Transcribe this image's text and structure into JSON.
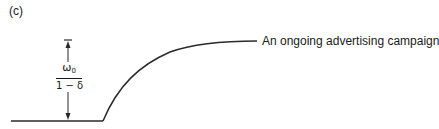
{
  "figure": {
    "panel_label": "(c)",
    "curve_label": "An ongoing advertising campaign",
    "dimension_annotation": {
      "numerator_symbol": "ω",
      "numerator_subscript": "0",
      "denominator": "1 − δ"
    },
    "colors": {
      "line": "#2a2a2a",
      "background": "#ffffff"
    }
  }
}
